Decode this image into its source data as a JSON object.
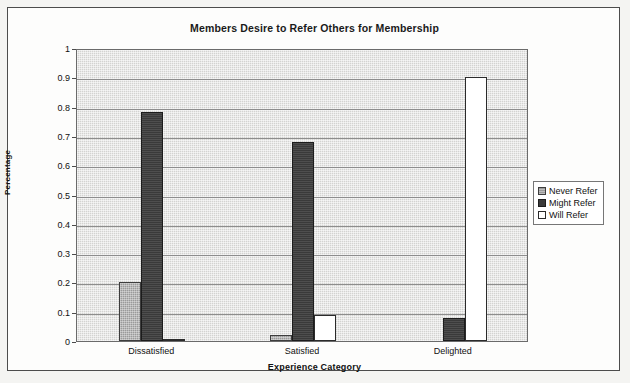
{
  "chart_data": {
    "type": "bar",
    "title": "Members Desire to Refer Others for Membership",
    "xlabel": "Experience Category",
    "ylabel": "Percentage",
    "categories": [
      "Dissatisfied",
      "Satisfied",
      "Delighted"
    ],
    "series": [
      {
        "name": "Never Refer",
        "values": [
          0.2,
          0.02,
          0.0
        ]
      },
      {
        "name": "Might Refer",
        "values": [
          0.78,
          0.68,
          0.08
        ]
      },
      {
        "name": "Will Refer",
        "values": [
          0.005,
          0.09,
          0.9
        ]
      }
    ],
    "ylim": [
      0,
      1
    ],
    "yticks": [
      "0",
      "0.1",
      "0.2",
      "0.3",
      "0.4",
      "0.5",
      "0.6",
      "0.7",
      "0.8",
      "0.9",
      "1"
    ],
    "ytick_values": [
      0,
      0.1,
      0.2,
      0.3,
      0.4,
      0.5,
      0.6,
      0.7,
      0.8,
      0.9,
      1
    ],
    "grid": true,
    "legend_position": "right",
    "colors": {
      "never_refer": "#9a9a9a",
      "might_refer": "#3a3a3a",
      "will_refer": "#ffffff",
      "plot_background": "#d3d3d1",
      "gridline": "#8d8d8d",
      "axis": "#4c4c4c",
      "text": "#111111"
    }
  }
}
